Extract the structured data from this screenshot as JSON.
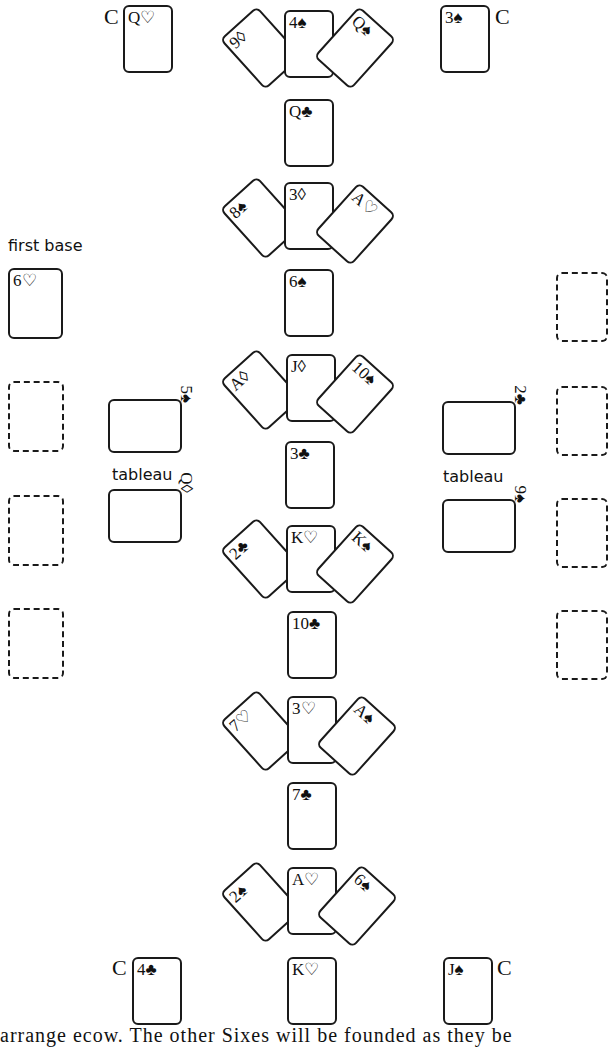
{
  "labels": {
    "first_base": "first base",
    "tableau_left": "tableau",
    "tableau_right": "tableau",
    "c_mark": "C"
  },
  "corner_cards": {
    "top_left": "Q♡",
    "top_right": "3♠",
    "bottom_left": "4♣",
    "bottom_right": "J♠"
  },
  "center_column": {
    "fans": [
      {
        "left": "9◊",
        "center": "4♠",
        "right": "Q♠"
      },
      {
        "left": "8♠",
        "center": "3◊",
        "right": "A♡"
      },
      {
        "left": "A◊",
        "center": "J◊",
        "right": "10♠"
      },
      {
        "left": "2♣",
        "center": "K♡",
        "right": "K♠"
      },
      {
        "left": "7♡",
        "center": "3♡",
        "right": "A♠"
      },
      {
        "left": "2♠",
        "center": "A♡",
        "right": "6♠"
      }
    ],
    "singles": [
      "Q♣",
      "6♠",
      "3♣",
      "10♣",
      "7♣",
      "K♡"
    ]
  },
  "left_side": {
    "first_base_card": "6♡",
    "tableau_cards": [
      "5♠",
      "Q◊"
    ],
    "empty_slots": 3
  },
  "right_side": {
    "tableau_cards": [
      "2♣",
      "9♠"
    ],
    "empty_slots": 4
  },
  "footer_text": "arrange ecow.  The other Sixes will be founded as they be"
}
